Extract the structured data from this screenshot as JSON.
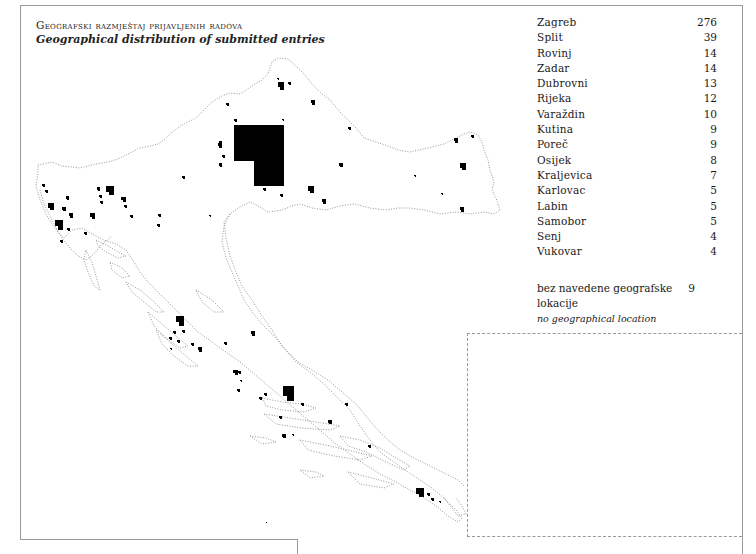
{
  "title": {
    "hr": "Geografski razmještaj prijavljenih radova",
    "en": "Geographical distribution of submitted entries"
  },
  "legend": {
    "items": [
      {
        "city": "Zagreb",
        "count": "276"
      },
      {
        "city": "Split",
        "count": "39"
      },
      {
        "city": "Rovinj",
        "count": "14"
      },
      {
        "city": "Zadar",
        "count": "14"
      },
      {
        "city": "Dubrovni",
        "count": "13"
      },
      {
        "city": "Rijeka",
        "count": "12"
      },
      {
        "city": "Varaždin",
        "count": "10"
      },
      {
        "city": "Kutina",
        "count": "9"
      },
      {
        "city": "Poreč",
        "count": "9"
      },
      {
        "city": "Osijek",
        "count": "8"
      },
      {
        "city": "Kraljevica",
        "count": "7"
      },
      {
        "city": "Karlovac",
        "count": "5"
      },
      {
        "city": "Labin",
        "count": "5"
      },
      {
        "city": "Samobor",
        "count": "5"
      },
      {
        "city": "Senj",
        "count": "4"
      },
      {
        "city": "Vukovar",
        "count": "4"
      }
    ],
    "no_location": {
      "label_hr": "bez navedene geografske lokacije",
      "label_en": "no geographical location",
      "count": "9"
    }
  },
  "map": {
    "region": "Croatia",
    "marker_color": "#000000",
    "outline_color": "#8a8a8a",
    "markers": [
      {
        "x": 234,
        "y": 125,
        "w": 50,
        "h": 61,
        "notch_w": 20,
        "notch_h": 25,
        "label": "Zagreb"
      },
      {
        "x": 283,
        "y": 386,
        "w": 11,
        "h": 15,
        "label": "Split"
      },
      {
        "x": 176,
        "y": 316,
        "w": 8,
        "h": 10,
        "label": "Zadar"
      },
      {
        "x": 416,
        "y": 488,
        "w": 8,
        "h": 9,
        "label": "Dubrovnik"
      },
      {
        "x": 106,
        "y": 186,
        "w": 8,
        "h": 9,
        "label": "Rijeka"
      },
      {
        "x": 278,
        "y": 82,
        "w": 6,
        "h": 8,
        "label": "Varaždin"
      },
      {
        "x": 308,
        "y": 186,
        "w": 6,
        "h": 7,
        "label": "Kutina"
      },
      {
        "x": 55,
        "y": 220,
        "w": 8,
        "h": 10,
        "label": "Rovinj"
      },
      {
        "x": 48,
        "y": 203,
        "w": 6,
        "h": 7,
        "label": "Poreč"
      },
      {
        "x": 460,
        "y": 163,
        "w": 6,
        "h": 7,
        "label": "Osijek"
      },
      {
        "x": 90,
        "y": 213,
        "w": 5,
        "h": 6,
        "label": "Karlovac"
      },
      {
        "x": 121,
        "y": 197,
        "w": 5,
        "h": 5,
        "label": "Kraljevica"
      },
      {
        "x": 69,
        "y": 213,
        "w": 4,
        "h": 5,
        "label": "Labin"
      },
      {
        "x": 218,
        "y": 143,
        "w": 4,
        "h": 5,
        "label": "Samobor"
      },
      {
        "x": 460,
        "y": 207,
        "w": 4,
        "h": 5,
        "label": "Vukovar"
      },
      {
        "x": 62,
        "y": 207,
        "w": 4,
        "h": 4
      },
      {
        "x": 45,
        "y": 190,
        "w": 3,
        "h": 3
      },
      {
        "x": 42,
        "y": 184,
        "w": 3,
        "h": 3
      },
      {
        "x": 66,
        "y": 196,
        "w": 3,
        "h": 4
      },
      {
        "x": 67,
        "y": 228,
        "w": 3,
        "h": 3
      },
      {
        "x": 60,
        "y": 240,
        "w": 3,
        "h": 3
      },
      {
        "x": 84,
        "y": 232,
        "w": 3,
        "h": 3
      },
      {
        "x": 97,
        "y": 187,
        "w": 3,
        "h": 4
      },
      {
        "x": 99,
        "y": 195,
        "w": 3,
        "h": 3
      },
      {
        "x": 100,
        "y": 201,
        "w": 3,
        "h": 3
      },
      {
        "x": 124,
        "y": 205,
        "w": 3,
        "h": 3
      },
      {
        "x": 130,
        "y": 215,
        "w": 3,
        "h": 3
      },
      {
        "x": 157,
        "y": 224,
        "w": 3,
        "h": 3
      },
      {
        "x": 158,
        "y": 214,
        "w": 3,
        "h": 3
      },
      {
        "x": 182,
        "y": 176,
        "w": 3,
        "h": 3
      },
      {
        "x": 209,
        "y": 215,
        "w": 2,
        "h": 2
      },
      {
        "x": 219,
        "y": 163,
        "w": 3,
        "h": 4
      },
      {
        "x": 222,
        "y": 155,
        "w": 3,
        "h": 3
      },
      {
        "x": 226,
        "y": 103,
        "w": 3,
        "h": 3
      },
      {
        "x": 219,
        "y": 141,
        "w": 3,
        "h": 3
      },
      {
        "x": 234,
        "y": 119,
        "w": 3,
        "h": 3
      },
      {
        "x": 263,
        "y": 188,
        "w": 3,
        "h": 3
      },
      {
        "x": 280,
        "y": 194,
        "w": 3,
        "h": 3
      },
      {
        "x": 277,
        "y": 78,
        "w": 2,
        "h": 2
      },
      {
        "x": 288,
        "y": 82,
        "w": 3,
        "h": 3
      },
      {
        "x": 311,
        "y": 100,
        "w": 4,
        "h": 5
      },
      {
        "x": 282,
        "y": 119,
        "w": 2,
        "h": 2
      },
      {
        "x": 322,
        "y": 199,
        "w": 4,
        "h": 5
      },
      {
        "x": 339,
        "y": 163,
        "w": 4,
        "h": 4
      },
      {
        "x": 348,
        "y": 127,
        "w": 3,
        "h": 3
      },
      {
        "x": 414,
        "y": 175,
        "w": 2,
        "h": 2
      },
      {
        "x": 441,
        "y": 193,
        "w": 2,
        "h": 2
      },
      {
        "x": 454,
        "y": 138,
        "w": 4,
        "h": 5
      },
      {
        "x": 471,
        "y": 135,
        "w": 3,
        "h": 3
      },
      {
        "x": 182,
        "y": 330,
        "w": 3,
        "h": 3
      },
      {
        "x": 173,
        "y": 331,
        "w": 3,
        "h": 3
      },
      {
        "x": 169,
        "y": 337,
        "w": 3,
        "h": 3
      },
      {
        "x": 177,
        "y": 340,
        "w": 3,
        "h": 3
      },
      {
        "x": 191,
        "y": 343,
        "w": 3,
        "h": 3
      },
      {
        "x": 198,
        "y": 347,
        "w": 4,
        "h": 5
      },
      {
        "x": 170,
        "y": 348,
        "w": 2,
        "h": 2
      },
      {
        "x": 224,
        "y": 342,
        "w": 3,
        "h": 3
      },
      {
        "x": 251,
        "y": 331,
        "w": 4,
        "h": 5
      },
      {
        "x": 233,
        "y": 370,
        "w": 5,
        "h": 5
      },
      {
        "x": 238,
        "y": 371,
        "w": 3,
        "h": 3
      },
      {
        "x": 240,
        "y": 380,
        "w": 2,
        "h": 2
      },
      {
        "x": 237,
        "y": 389,
        "w": 3,
        "h": 3
      },
      {
        "x": 264,
        "y": 393,
        "w": 3,
        "h": 3
      },
      {
        "x": 259,
        "y": 397,
        "w": 3,
        "h": 3
      },
      {
        "x": 301,
        "y": 403,
        "w": 3,
        "h": 3
      },
      {
        "x": 345,
        "y": 403,
        "w": 3,
        "h": 3
      },
      {
        "x": 279,
        "y": 416,
        "w": 3,
        "h": 3
      },
      {
        "x": 328,
        "y": 420,
        "w": 4,
        "h": 4
      },
      {
        "x": 282,
        "y": 434,
        "w": 4,
        "h": 4
      },
      {
        "x": 292,
        "y": 434,
        "w": 2,
        "h": 2
      },
      {
        "x": 368,
        "y": 445,
        "w": 3,
        "h": 3
      },
      {
        "x": 427,
        "y": 493,
        "w": 3,
        "h": 3
      },
      {
        "x": 431,
        "y": 498,
        "w": 3,
        "h": 3
      },
      {
        "x": 439,
        "y": 501,
        "w": 2,
        "h": 2
      },
      {
        "x": 265,
        "y": 522,
        "w": 2,
        "h": 1
      }
    ]
  }
}
